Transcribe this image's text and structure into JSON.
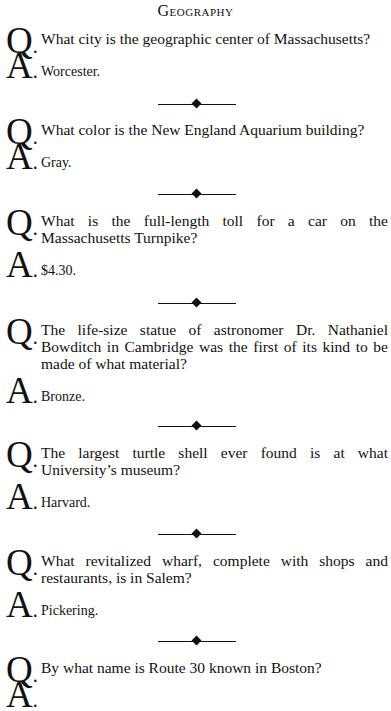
{
  "page": {
    "title": "Geography",
    "q_marker": "Q",
    "a_marker": "A",
    "items": [
      {
        "question": "What city is the geographic center of Massachusetts?",
        "answer": "Worcester."
      },
      {
        "question": "What color is the New England Aquarium building?",
        "answer": "Gray."
      },
      {
        "question": "What is the full-length toll for a car on the Massachusetts Turnpike?",
        "answer": "$4.30."
      },
      {
        "question": "The life-size statue of astronomer Dr. Nathaniel Bowditch in Cambridge was the first of its kind to be made of what material?",
        "answer": "Bronze."
      },
      {
        "question": "The largest turtle shell ever found is at what University’s museum?",
        "answer": "Harvard."
      },
      {
        "question": "What revitalized wharf, complete with shops and restaurants, is in Salem?",
        "answer": "Pickering."
      },
      {
        "question": "By what name is Route 30 known in Boston?",
        "answer": ""
      }
    ]
  }
}
